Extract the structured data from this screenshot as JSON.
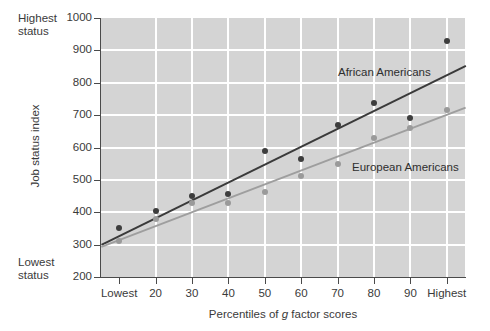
{
  "chart_data": {
    "type": "scatter",
    "title": "",
    "xlabel": "Percentiles of g factor scores",
    "ylabel": "Job status index",
    "categories": [
      "Lowest",
      "20",
      "30",
      "40",
      "50",
      "60",
      "70",
      "80",
      "90",
      "Highest"
    ],
    "x": [
      10,
      20,
      30,
      40,
      50,
      60,
      70,
      80,
      90,
      100
    ],
    "ylim": [
      200,
      1000
    ],
    "yticks": [
      200,
      300,
      400,
      500,
      600,
      700,
      800,
      900,
      1000
    ],
    "grid": true,
    "legend_position": "inline-annotation",
    "series": [
      {
        "name": "African Americans",
        "color": "#3d3d3d",
        "values": [
          350,
          405,
          450,
          455,
          590,
          563,
          668,
          738,
          690,
          930
        ],
        "fit_line": {
          "y_start": 303,
          "y_end": 855
        }
      },
      {
        "name": "European Americans",
        "color": "#9a9a9a",
        "values": [
          310,
          380,
          430,
          428,
          462,
          512,
          548,
          628,
          660,
          715
        ],
        "fit_line": {
          "y_start": 296,
          "y_end": 726
        }
      }
    ],
    "annotations": [
      {
        "text": "Highest status",
        "position": "top-left-of-y-axis"
      },
      {
        "text": "Lowest status",
        "position": "bottom-left-of-y-axis"
      }
    ]
  },
  "axis": {
    "y_tick_labels": [
      "1000",
      "900",
      "800",
      "700",
      "600",
      "500",
      "400",
      "300",
      "200"
    ],
    "x_tick_labels": [
      "Lowest",
      "20",
      "30",
      "40",
      "50",
      "60",
      "70",
      "80",
      "90",
      "Highest"
    ],
    "y_title": "Job status index",
    "x_title_prefix": "Percentiles of ",
    "x_title_italic": "g",
    "x_title_suffix": " factor scores"
  },
  "notes": {
    "highest_status": "Highest\nstatus",
    "lowest_status": "Lowest\nstatus"
  },
  "series_labels": {
    "african": "African Americans",
    "european": "European Americans"
  }
}
